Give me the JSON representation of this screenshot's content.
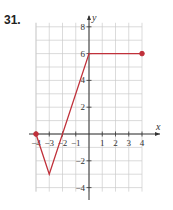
{
  "problem_number": "31.",
  "chart_data": {
    "type": "line",
    "title": "",
    "xlabel": "x",
    "ylabel": "y",
    "xlim": [
      -4,
      4
    ],
    "ylim": [
      -4,
      8
    ],
    "grid": true,
    "x_ticks": [
      -4,
      -3,
      -2,
      -1,
      1,
      2,
      3,
      4
    ],
    "y_ticks": [
      -4,
      -2,
      2,
      4,
      6,
      8
    ],
    "x_tick_labels": [
      "-4",
      "-3",
      "-2",
      "-1",
      "1",
      "2",
      "3",
      "4"
    ],
    "y_tick_labels": [
      "-4",
      "-2",
      "2",
      "4",
      "6",
      "8"
    ],
    "series": [
      {
        "name": "f",
        "color": "#c0303a",
        "points": [
          [
            -4,
            0
          ],
          [
            -3,
            -3
          ],
          [
            0,
            6
          ],
          [
            4,
            6
          ]
        ],
        "endpoints": [
          {
            "x": -4,
            "y": 0,
            "closed": true
          },
          {
            "x": 4,
            "y": 6,
            "closed": true
          }
        ]
      }
    ]
  }
}
